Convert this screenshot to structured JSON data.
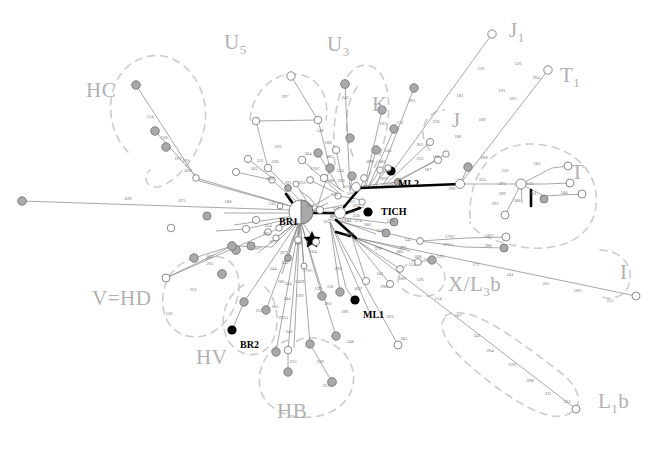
{
  "figure": {
    "type": "median-joining-haplotype-network",
    "background": "#ffffff",
    "dimensions": {
      "width": 658,
      "height": 452
    },
    "line_color": "#808080",
    "node_outline": "#707070",
    "node_fill_empty": "#ffffff",
    "node_fill_shaded": "#a8a8a8",
    "node_fill_solid": "#000000",
    "haplogroup_label_color": "#b8b8b8",
    "dashed_ellipse_color": "#c8c8c8",
    "mutation_label_color": "#6e6e6e"
  },
  "haplogroup_labels": [
    {
      "name": "HC",
      "text": "HC",
      "sub": "",
      "x": 86,
      "y": 78
    },
    {
      "name": "U5",
      "text": "U",
      "sub": "5",
      "x": 224,
      "y": 30
    },
    {
      "name": "U3",
      "text": "U",
      "sub": "3",
      "x": 327,
      "y": 32
    },
    {
      "name": "K",
      "text": "K",
      "sub": "",
      "x": 372,
      "y": 92
    },
    {
      "name": "J1",
      "text": "J",
      "sub": "1",
      "x": 509,
      "y": 18
    },
    {
      "name": "T1",
      "text": "T",
      "sub": "1",
      "x": 560,
      "y": 63
    },
    {
      "name": "J",
      "text": "J",
      "sub": "",
      "x": 452,
      "y": 108
    },
    {
      "name": "T",
      "text": "T",
      "sub": "",
      "x": 571,
      "y": 160
    },
    {
      "name": "I",
      "text": "I",
      "sub": "",
      "x": 620,
      "y": 260
    },
    {
      "name": "XL3b",
      "text": "X/L",
      "sub": "3",
      "suffix": "b",
      "x": 448,
      "y": 272
    },
    {
      "name": "L1b",
      "text": "L",
      "sub": "1",
      "suffix": "b",
      "x": 598,
      "y": 389
    },
    {
      "name": "VHD",
      "text": "V=HD",
      "sub": "",
      "x": 92,
      "y": 286
    },
    {
      "name": "HV",
      "text": "HV",
      "sub": "",
      "x": 196,
      "y": 345
    },
    {
      "name": "HB",
      "text": "HB",
      "sub": "",
      "x": 277,
      "y": 399
    }
  ],
  "sample_labels": [
    {
      "name": "BR1",
      "text": "BR1",
      "x": 279,
      "y": 216
    },
    {
      "name": "BR2",
      "text": "BR2",
      "x": 240,
      "y": 339
    },
    {
      "name": "ML1",
      "text": "ML1",
      "x": 363,
      "y": 309
    },
    {
      "name": "ML2",
      "text": "ML2",
      "x": 398,
      "y": 178
    },
    {
      "name": "TICH",
      "text": "TICH",
      "x": 381,
      "y": 206
    }
  ],
  "mutation_labels": [
    {
      "t": "039",
      "x": 128,
      "y": 200
    },
    {
      "t": "075",
      "x": 182,
      "y": 202
    },
    {
      "t": "188",
      "x": 228,
      "y": 203
    },
    {
      "t": "230",
      "x": 272,
      "y": 205
    },
    {
      "t": "264",
      "x": 310,
      "y": 207
    },
    {
      "t": "356",
      "x": 336,
      "y": 210
    },
    {
      "t": "069",
      "x": 334,
      "y": 196
    },
    {
      "t": "111",
      "x": 352,
      "y": 203
    },
    {
      "t": "221",
      "x": 345,
      "y": 221
    },
    {
      "t": "354",
      "x": 268,
      "y": 227
    },
    {
      "t": "033",
      "x": 327,
      "y": 223
    },
    {
      "t": "124",
      "x": 351,
      "y": 213
    },
    {
      "t": "274",
      "x": 358,
      "y": 222
    },
    {
      "t": "085",
      "x": 368,
      "y": 226
    },
    {
      "t": "298",
      "x": 350,
      "y": 235
    },
    {
      "t": "073",
      "x": 330,
      "y": 215
    },
    {
      "t": "154",
      "x": 150,
      "y": 118
    },
    {
      "t": "128",
      "x": 164,
      "y": 139
    },
    {
      "t": "167",
      "x": 178,
      "y": 160
    },
    {
      "t": "039",
      "x": 188,
      "y": 172
    },
    {
      "t": "191",
      "x": 186,
      "y": 162
    },
    {
      "t": "192",
      "x": 278,
      "y": 148
    },
    {
      "t": "311",
      "x": 260,
      "y": 162
    },
    {
      "t": "220",
      "x": 275,
      "y": 163
    },
    {
      "t": "105",
      "x": 254,
      "y": 170
    },
    {
      "t": "228",
      "x": 270,
      "y": 180
    },
    {
      "t": "291",
      "x": 288,
      "y": 184
    },
    {
      "t": "256",
      "x": 302,
      "y": 184
    },
    {
      "t": "297",
      "x": 285,
      "y": 98
    },
    {
      "t": "343",
      "x": 345,
      "y": 99
    },
    {
      "t": "148",
      "x": 320,
      "y": 132
    },
    {
      "t": "188",
      "x": 328,
      "y": 144
    },
    {
      "t": "304",
      "x": 308,
      "y": 155
    },
    {
      "t": "085",
      "x": 330,
      "y": 158
    },
    {
      "t": "176C",
      "x": 315,
      "y": 170
    },
    {
      "t": "224",
      "x": 340,
      "y": 172
    },
    {
      "t": "180",
      "x": 331,
      "y": 182
    },
    {
      "t": "266",
      "x": 341,
      "y": 182
    },
    {
      "t": "311",
      "x": 346,
      "y": 188
    },
    {
      "t": "193",
      "x": 383,
      "y": 125
    },
    {
      "t": "222",
      "x": 400,
      "y": 124
    },
    {
      "t": "261",
      "x": 412,
      "y": 102
    },
    {
      "t": "145",
      "x": 388,
      "y": 152
    },
    {
      "t": "098",
      "x": 370,
      "y": 163
    },
    {
      "t": "085",
      "x": 382,
      "y": 163
    },
    {
      "t": "274",
      "x": 386,
      "y": 172
    },
    {
      "t": "069",
      "x": 384,
      "y": 180
    },
    {
      "t": "126",
      "x": 350,
      "y": 195
    },
    {
      "t": "225",
      "x": 420,
      "y": 160
    },
    {
      "t": "163",
      "x": 436,
      "y": 158
    },
    {
      "t": "187",
      "x": 428,
      "y": 171
    },
    {
      "t": "220",
      "x": 436,
      "y": 123
    },
    {
      "t": "261",
      "x": 420,
      "y": 146
    },
    {
      "t": "181",
      "x": 460,
      "y": 97
    },
    {
      "t": "126",
      "x": 481,
      "y": 70
    },
    {
      "t": "189",
      "x": 482,
      "y": 121
    },
    {
      "t": "186",
      "x": 458,
      "y": 138
    },
    {
      "t": "191",
      "x": 502,
      "y": 92
    },
    {
      "t": "126",
      "x": 518,
      "y": 65
    },
    {
      "t": "293",
      "x": 513,
      "y": 100
    },
    {
      "t": "294",
      "x": 536,
      "y": 79
    },
    {
      "t": "324",
      "x": 482,
      "y": 181
    },
    {
      "t": "296",
      "x": 452,
      "y": 190
    },
    {
      "t": "189",
      "x": 484,
      "y": 159
    },
    {
      "t": "156",
      "x": 505,
      "y": 172
    },
    {
      "t": "183",
      "x": 537,
      "y": 165
    },
    {
      "t": "293",
      "x": 502,
      "y": 185
    },
    {
      "t": "153",
      "x": 530,
      "y": 185
    },
    {
      "t": "189",
      "x": 502,
      "y": 195
    },
    {
      "t": "311",
      "x": 533,
      "y": 195
    },
    {
      "t": "288",
      "x": 517,
      "y": 202
    },
    {
      "t": "140",
      "x": 564,
      "y": 194
    },
    {
      "t": "293",
      "x": 495,
      "y": 205
    },
    {
      "t": "294",
      "x": 356,
      "y": 207
    },
    {
      "t": "350",
      "x": 356,
      "y": 217
    },
    {
      "t": "140",
      "x": 348,
      "y": 222
    },
    {
      "t": "176",
      "x": 390,
      "y": 222
    },
    {
      "t": "342",
      "x": 380,
      "y": 232
    },
    {
      "t": "222",
      "x": 348,
      "y": 236
    },
    {
      "t": "145",
      "x": 408,
      "y": 241
    },
    {
      "t": "176C",
      "x": 450,
      "y": 238
    },
    {
      "t": "367",
      "x": 490,
      "y": 237
    },
    {
      "t": "176A",
      "x": 448,
      "y": 246
    },
    {
      "t": "390",
      "x": 488,
      "y": 247
    },
    {
      "t": "093",
      "x": 403,
      "y": 249
    },
    {
      "t": "228",
      "x": 378,
      "y": 250
    },
    {
      "t": "085",
      "x": 400,
      "y": 253
    },
    {
      "t": "098",
      "x": 418,
      "y": 258
    },
    {
      "t": "129",
      "x": 440,
      "y": 258
    },
    {
      "t": "124",
      "x": 412,
      "y": 266
    },
    {
      "t": "172",
      "x": 476,
      "y": 266
    },
    {
      "t": "241",
      "x": 510,
      "y": 276
    },
    {
      "t": "265",
      "x": 546,
      "y": 285
    },
    {
      "t": "283",
      "x": 578,
      "y": 292
    },
    {
      "t": "255",
      "x": 610,
      "y": 302
    },
    {
      "t": "241",
      "x": 380,
      "y": 275
    },
    {
      "t": "189",
      "x": 402,
      "y": 280
    },
    {
      "t": "126",
      "x": 420,
      "y": 281
    },
    {
      "t": "154",
      "x": 438,
      "y": 300
    },
    {
      "t": "187",
      "x": 458,
      "y": 317
    },
    {
      "t": "241",
      "x": 477,
      "y": 337
    },
    {
      "t": "264",
      "x": 490,
      "y": 352
    },
    {
      "t": "270",
      "x": 512,
      "y": 366
    },
    {
      "t": "298",
      "x": 530,
      "y": 382
    },
    {
      "t": "311",
      "x": 548,
      "y": 395
    },
    {
      "t": "333",
      "x": 567,
      "y": 403
    },
    {
      "t": "292",
      "x": 338,
      "y": 270
    },
    {
      "t": "059",
      "x": 358,
      "y": 290
    },
    {
      "t": "290",
      "x": 384,
      "y": 288
    },
    {
      "t": "293",
      "x": 390,
      "y": 318
    },
    {
      "t": "305",
      "x": 404,
      "y": 340
    },
    {
      "t": "110",
      "x": 330,
      "y": 288
    },
    {
      "t": "129",
      "x": 318,
      "y": 290
    },
    {
      "t": "261",
      "x": 328,
      "y": 305
    },
    {
      "t": "296",
      "x": 345,
      "y": 313
    },
    {
      "t": "248",
      "x": 350,
      "y": 343
    },
    {
      "t": "176C",
      "x": 308,
      "y": 272
    },
    {
      "t": "246T",
      "x": 300,
      "y": 283
    },
    {
      "t": "192",
      "x": 300,
      "y": 297
    },
    {
      "t": "244",
      "x": 287,
      "y": 300
    },
    {
      "t": "304",
      "x": 288,
      "y": 285
    },
    {
      "t": "186",
      "x": 281,
      "y": 283
    },
    {
      "t": "185",
      "x": 275,
      "y": 308
    },
    {
      "t": "296A",
      "x": 283,
      "y": 319
    },
    {
      "t": "246",
      "x": 289,
      "y": 333
    },
    {
      "t": "255",
      "x": 293,
      "y": 363
    },
    {
      "t": "129",
      "x": 320,
      "y": 363
    },
    {
      "t": "223",
      "x": 326,
      "y": 387
    },
    {
      "t": "344",
      "x": 273,
      "y": 270
    },
    {
      "t": "355",
      "x": 259,
      "y": 312
    },
    {
      "t": "342",
      "x": 285,
      "y": 264
    },
    {
      "t": "297",
      "x": 283,
      "y": 254
    },
    {
      "t": "289",
      "x": 298,
      "y": 245
    },
    {
      "t": "164",
      "x": 313,
      "y": 253
    },
    {
      "t": "067",
      "x": 258,
      "y": 250
    },
    {
      "t": "039",
      "x": 210,
      "y": 258
    },
    {
      "t": "265",
      "x": 210,
      "y": 265
    },
    {
      "t": "322",
      "x": 193,
      "y": 291
    },
    {
      "t": "126",
      "x": 169,
      "y": 315
    },
    {
      "t": "077",
      "x": 273,
      "y": 243
    },
    {
      "t": "290",
      "x": 266,
      "y": 235
    }
  ],
  "nodes_legend": {
    "empty_circle": "haplotype absent in shaded population",
    "shaded_circle": "haplotype present",
    "solid_black_circle": "ancient sample",
    "star": "root / median vector",
    "pie_node": "BR1 shared haplotype"
  }
}
